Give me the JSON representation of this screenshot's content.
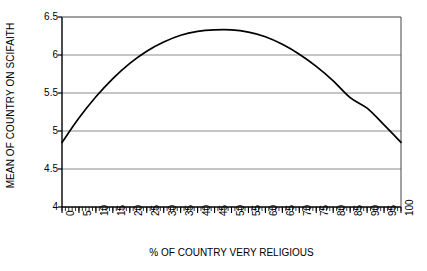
{
  "chart_data": {
    "type": "line",
    "title": "",
    "xlabel": "% OF COUNTRY VERY RELIGIOUS",
    "ylabel": "MEAN OF COUNTRY ON SCIFAITH",
    "xlim": [
      0,
      100
    ],
    "ylim": [
      4,
      6.5
    ],
    "grid": true,
    "legend": null,
    "line_color": "#000000",
    "grid_color": "#808080",
    "axis_color": "#000000",
    "background": "#ffffff",
    "y_ticks": [
      "4",
      "4.5",
      "5",
      "5.5",
      "6",
      "6.5"
    ],
    "y_tick_values": [
      4,
      4.5,
      5,
      5.5,
      6,
      6.5
    ],
    "x_ticks": [
      "0",
      "5",
      "10",
      "15",
      "20",
      "25",
      "30",
      "35",
      "40",
      "45",
      "50",
      "55",
      "60",
      "65",
      "70",
      "75",
      "80",
      "85",
      "90",
      "95",
      "100"
    ],
    "x_tick_values": [
      0,
      5,
      10,
      15,
      20,
      25,
      30,
      35,
      40,
      45,
      50,
      55,
      60,
      65,
      70,
      75,
      80,
      85,
      90,
      95,
      100
    ],
    "x_minor_tick_step": 1,
    "x": [
      0,
      5,
      10,
      15,
      20,
      25,
      30,
      35,
      40,
      45,
      50,
      55,
      60,
      65,
      70,
      75,
      80,
      85,
      90,
      95,
      100
    ],
    "values": [
      4.85,
      5.17,
      5.45,
      5.69,
      5.89,
      6.05,
      6.17,
      6.26,
      6.31,
      6.33,
      6.33,
      6.3,
      6.24,
      6.14,
      6.01,
      5.85,
      5.66,
      5.44,
      5.3,
      5.08,
      4.85
    ],
    "series": [
      {
        "name": "Mean SCIFAITH",
        "values": [
          4.85,
          5.17,
          5.45,
          5.69,
          5.89,
          6.05,
          6.17,
          6.26,
          6.31,
          6.33,
          6.33,
          6.3,
          6.24,
          6.14,
          6.01,
          5.85,
          5.66,
          5.44,
          5.3,
          5.08,
          4.85
        ]
      }
    ],
    "annotations": []
  }
}
